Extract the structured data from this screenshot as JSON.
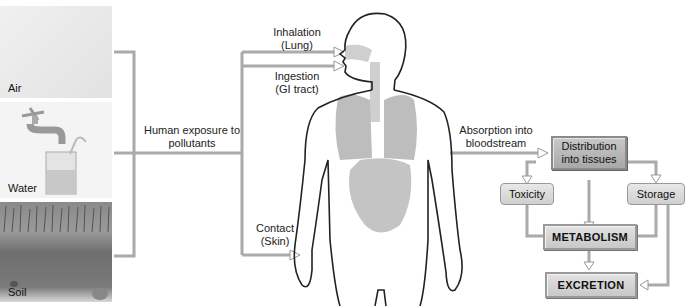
{
  "sources": {
    "air": "Air",
    "water": "Water",
    "soil": "Soil"
  },
  "exposure_label": "Human exposure to pollutants",
  "routes": {
    "inhalation": [
      "Inhalation",
      "(Lung)"
    ],
    "ingestion": [
      "Ingestion",
      "(GI tract)"
    ],
    "contact": [
      "Contact",
      "(Skin)"
    ]
  },
  "absorption_label": [
    "Absorption into",
    "bloodstream"
  ],
  "boxes": {
    "distribution": [
      "Distribution",
      "into tissues"
    ],
    "toxicity": "Toxicity",
    "storage": "Storage",
    "metabolism": "METABOLISM",
    "excretion": "EXCRETION"
  }
}
